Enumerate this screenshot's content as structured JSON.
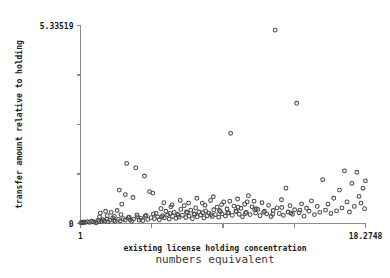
{
  "chart_data": {
    "type": "scatter",
    "title": "",
    "xlabel": "existing license holding concentration",
    "xlabel_secondary": "numbers equivalent",
    "ylabel": "transfer amount relative to holding",
    "xlim": [
      1,
      18.2748
    ],
    "ylim": [
      0,
      5.33519
    ],
    "xtick_labels": [
      "1",
      "18.2748"
    ],
    "ytick_labels": [
      "0",
      "5.33519"
    ],
    "xtick_values": [
      1,
      5.318,
      9.637,
      13.956,
      18.2748
    ],
    "ytick_values": [
      0,
      1.3338,
      2.6676,
      4.00139,
      5.33519
    ],
    "grid": false,
    "legend": null,
    "marker": "open-circle",
    "marker_color": "#4b4b4b",
    "axis_color": "#8a8a8a",
    "points": [
      [
        1.02,
        0.02
      ],
      [
        1.09,
        0.03
      ],
      [
        1.15,
        0.02
      ],
      [
        1.22,
        0.04
      ],
      [
        1.3,
        0.03
      ],
      [
        1.42,
        0.05
      ],
      [
        1.55,
        0.03
      ],
      [
        1.68,
        0.06
      ],
      [
        1.8,
        0.04
      ],
      [
        1.95,
        0.02
      ],
      [
        2.05,
        0.08
      ],
      [
        2.12,
        0.05
      ],
      [
        2.2,
        0.28
      ],
      [
        2.28,
        0.06
      ],
      [
        2.35,
        0.1
      ],
      [
        2.44,
        0.07
      ],
      [
        2.52,
        0.33
      ],
      [
        2.6,
        0.12
      ],
      [
        2.68,
        0.05
      ],
      [
        2.78,
        0.09
      ],
      [
        2.86,
        0.3
      ],
      [
        2.95,
        0.15
      ],
      [
        3.02,
        0.08
      ],
      [
        3.1,
        0.06
      ],
      [
        3.22,
        0.35
      ],
      [
        3.3,
        0.11
      ],
      [
        3.4,
        0.07
      ],
      [
        3.5,
        0.52
      ],
      [
        3.6,
        0.13
      ],
      [
        3.7,
        0.09
      ],
      [
        3.8,
        1.62
      ],
      [
        3.9,
        0.16
      ],
      [
        4.0,
        0.1
      ],
      [
        4.1,
        0.06
      ],
      [
        4.22,
        0.12
      ],
      [
        4.35,
        1.5
      ],
      [
        4.45,
        0.18
      ],
      [
        4.55,
        0.09
      ],
      [
        4.65,
        0.14
      ],
      [
        4.78,
        0.08
      ],
      [
        4.88,
        1.28
      ],
      [
        4.98,
        0.22
      ],
      [
        5.08,
        0.11
      ],
      [
        5.18,
        0.86
      ],
      [
        5.28,
        0.16
      ],
      [
        5.38,
        0.82
      ],
      [
        5.48,
        0.13
      ],
      [
        5.58,
        0.27
      ],
      [
        5.68,
        0.18
      ],
      [
        5.78,
        0.1
      ],
      [
        5.88,
        0.4
      ],
      [
        5.98,
        0.21
      ],
      [
        6.08,
        0.15
      ],
      [
        6.18,
        0.33
      ],
      [
        6.28,
        0.24
      ],
      [
        6.38,
        0.12
      ],
      [
        6.48,
        0.45
      ],
      [
        6.58,
        0.19
      ],
      [
        6.68,
        0.3
      ],
      [
        6.78,
        0.14
      ],
      [
        6.88,
        0.25
      ],
      [
        6.98,
        0.17
      ],
      [
        7.08,
        0.38
      ],
      [
        7.18,
        0.22
      ],
      [
        7.28,
        0.48
      ],
      [
        7.38,
        0.16
      ],
      [
        7.48,
        0.29
      ],
      [
        7.58,
        0.2
      ],
      [
        7.68,
        0.36
      ],
      [
        7.78,
        0.13
      ],
      [
        7.88,
        0.26
      ],
      [
        7.98,
        0.42
      ],
      [
        8.08,
        0.18
      ],
      [
        8.18,
        0.31
      ],
      [
        8.28,
        0.23
      ],
      [
        8.38,
        0.55
      ],
      [
        8.48,
        0.15
      ],
      [
        8.58,
        0.34
      ],
      [
        8.68,
        0.21
      ],
      [
        8.78,
        0.28
      ],
      [
        8.88,
        0.62
      ],
      [
        8.98,
        0.19
      ],
      [
        9.08,
        0.37
      ],
      [
        9.18,
        0.24
      ],
      [
        9.28,
        0.44
      ],
      [
        9.38,
        0.17
      ],
      [
        9.48,
        0.32
      ],
      [
        9.58,
        0.26
      ],
      [
        9.68,
        0.58
      ],
      [
        9.78,
        0.2
      ],
      [
        9.88,
        0.39
      ],
      [
        9.98,
        0.29
      ],
      [
        10.1,
        2.43
      ],
      [
        10.2,
        0.22
      ],
      [
        10.3,
        0.47
      ],
      [
        10.42,
        0.33
      ],
      [
        10.52,
        0.66
      ],
      [
        10.62,
        0.25
      ],
      [
        10.72,
        0.41
      ],
      [
        10.82,
        0.18
      ],
      [
        10.95,
        0.52
      ],
      [
        11.05,
        0.3
      ],
      [
        11.18,
        0.75
      ],
      [
        11.28,
        0.24
      ],
      [
        11.4,
        0.45
      ],
      [
        11.52,
        0.6
      ],
      [
        11.62,
        0.28
      ],
      [
        11.75,
        0.38
      ],
      [
        11.88,
        0.21
      ],
      [
        12.0,
        0.56
      ],
      [
        12.15,
        0.33
      ],
      [
        12.28,
        0.26
      ],
      [
        12.4,
        0.49
      ],
      [
        12.55,
        0.19
      ],
      [
        12.68,
        0.35
      ],
      [
        12.8,
        5.21
      ],
      [
        12.92,
        0.42
      ],
      [
        13.05,
        0.27
      ],
      [
        13.18,
        0.64
      ],
      [
        13.3,
        0.22
      ],
      [
        13.45,
        0.95
      ],
      [
        13.58,
        0.31
      ],
      [
        13.7,
        0.48
      ],
      [
        13.85,
        0.25
      ],
      [
        13.98,
        0.37
      ],
      [
        14.1,
        3.24
      ],
      [
        14.25,
        0.29
      ],
      [
        14.4,
        0.53
      ],
      [
        14.55,
        0.2
      ],
      [
        14.7,
        0.41
      ],
      [
        14.85,
        0.33
      ],
      [
        15.0,
        0.61
      ],
      [
        15.18,
        0.24
      ],
      [
        15.35,
        0.46
      ],
      [
        15.5,
        0.3
      ],
      [
        15.68,
        1.18
      ],
      [
        15.85,
        0.36
      ],
      [
        16.0,
        0.52
      ],
      [
        16.18,
        0.27
      ],
      [
        16.35,
        0.68
      ],
      [
        16.52,
        0.34
      ],
      [
        16.7,
        0.9
      ],
      [
        16.85,
        0.42
      ],
      [
        17.0,
        1.42
      ],
      [
        17.15,
        0.58
      ],
      [
        17.3,
        0.31
      ],
      [
        17.45,
        1.08
      ],
      [
        17.6,
        0.46
      ],
      [
        17.75,
        1.38
      ],
      [
        17.88,
        0.73
      ],
      [
        18.0,
        0.55
      ],
      [
        18.12,
        0.95
      ],
      [
        18.22,
        0.4
      ],
      [
        18.27,
        1.15
      ],
      [
        2.15,
        0.18
      ],
      [
        2.62,
        0.21
      ],
      [
        3.05,
        0.19
      ],
      [
        3.45,
        0.24
      ],
      [
        3.95,
        0.17
      ],
      [
        4.42,
        0.23
      ],
      [
        4.92,
        0.2
      ],
      [
        5.42,
        0.26
      ],
      [
        5.92,
        0.18
      ],
      [
        6.42,
        0.27
      ],
      [
        6.92,
        0.22
      ],
      [
        7.42,
        0.31
      ],
      [
        7.92,
        0.25
      ],
      [
        8.42,
        0.29
      ],
      [
        8.92,
        0.24
      ],
      [
        9.42,
        0.35
      ],
      [
        9.92,
        0.28
      ],
      [
        10.45,
        0.32
      ],
      [
        11.0,
        0.27
      ],
      [
        11.55,
        0.38
      ],
      [
        12.1,
        0.3
      ],
      [
        12.65,
        0.25
      ],
      [
        13.2,
        0.43
      ],
      [
        13.75,
        0.28
      ],
      [
        14.3,
        0.36
      ],
      [
        3.35,
        0.9
      ],
      [
        3.72,
        0.78
      ],
      [
        4.18,
        0.7
      ],
      [
        6.05,
        0.56
      ],
      [
        6.55,
        0.5
      ],
      [
        7.05,
        0.62
      ],
      [
        7.55,
        0.55
      ],
      [
        8.05,
        0.68
      ],
      [
        8.55,
        0.49
      ],
      [
        9.05,
        0.72
      ],
      [
        9.55,
        0.51
      ],
      [
        10.05,
        0.6
      ],
      [
        10.55,
        0.44
      ],
      [
        11.1,
        0.58
      ],
      [
        11.65,
        0.4
      ]
    ]
  }
}
